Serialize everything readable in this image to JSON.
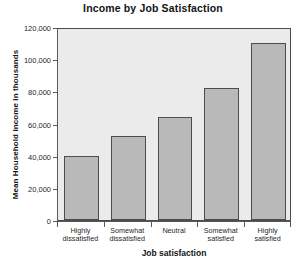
{
  "chart_data": {
    "type": "bar",
    "title": "Income by Job Satisfaction",
    "xlabel": "Job satisfaction",
    "ylabel": "Mean Household income in thousands",
    "categories": [
      "Highly\ndissatisfied",
      "Somewhat\ndissatisfied",
      "Neutral",
      "Somewhat\nsatisfied",
      "Highly\nsatisfied"
    ],
    "values": [
      40000,
      52000,
      64000,
      82000,
      110000
    ],
    "ylim": [
      0,
      120000
    ],
    "ytick_values": [
      0,
      20000,
      40000,
      60000,
      80000,
      100000,
      120000
    ],
    "ytick_labels": [
      "0",
      "20,000",
      "40,000",
      "60,000",
      "80,000",
      "100,000",
      "120,000"
    ],
    "grid": false,
    "legend": null,
    "bar_color": "#b9b9b9",
    "bar_border_color": "#4d4d4d",
    "plot_background": "#ebebeb",
    "figure_background": "#ffffff"
  }
}
